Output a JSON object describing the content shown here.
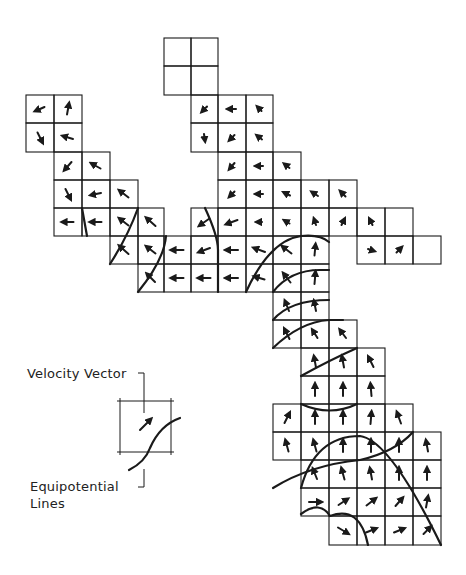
{
  "figure": {
    "cell_size": 28,
    "col_x": [
      26,
      54,
      82,
      110,
      138,
      164,
      191,
      218,
      246,
      273,
      301,
      329,
      357,
      385,
      413,
      441
    ],
    "row_y": [
      38,
      66,
      95,
      123,
      152,
      180,
      208,
      236,
      264,
      292,
      320,
      348,
      376,
      404,
      432,
      460,
      488,
      516,
      545
    ],
    "cells": [
      {
        "r": 0,
        "c": 5,
        "v": null
      },
      {
        "r": 0,
        "c": 6,
        "v": null
      },
      {
        "r": 1,
        "c": 5,
        "v": null
      },
      {
        "r": 1,
        "c": 6,
        "v": null
      },
      {
        "r": 2,
        "c": 0,
        "v": [
          -9,
          4
        ]
      },
      {
        "r": 2,
        "c": 1,
        "v": [
          2,
          -11
        ]
      },
      {
        "r": 2,
        "c": 6,
        "v": [
          -5,
          5
        ]
      },
      {
        "r": 2,
        "c": 7,
        "v": [
          -8,
          0
        ]
      },
      {
        "r": 2,
        "c": 8,
        "v": [
          -4,
          -4
        ]
      },
      {
        "r": 3,
        "c": 0,
        "v": [
          5,
          10
        ]
      },
      {
        "r": 3,
        "c": 1,
        "v": [
          -10,
          -3
        ]
      },
      {
        "r": 3,
        "c": 6,
        "v": [
          1,
          7
        ]
      },
      {
        "r": 3,
        "c": 7,
        "v": [
          -5,
          5
        ]
      },
      {
        "r": 3,
        "c": 8,
        "v": [
          -5,
          -4
        ]
      },
      {
        "r": 4,
        "c": 1,
        "v": [
          -7,
          8
        ]
      },
      {
        "r": 4,
        "c": 2,
        "v": [
          -9,
          -5
        ]
      },
      {
        "r": 4,
        "c": 7,
        "v": [
          -5,
          6
        ]
      },
      {
        "r": 4,
        "c": 8,
        "v": [
          -7,
          0
        ]
      },
      {
        "r": 4,
        "c": 9,
        "v": [
          -5,
          -4
        ]
      },
      {
        "r": 5,
        "c": 1,
        "v": [
          5,
          10
        ]
      },
      {
        "r": 5,
        "c": 2,
        "v": [
          -10,
          2
        ]
      },
      {
        "r": 5,
        "c": 3,
        "v": [
          -9,
          -7
        ]
      },
      {
        "r": 5,
        "c": 7,
        "v": [
          -5,
          5
        ]
      },
      {
        "r": 5,
        "c": 8,
        "v": [
          -7,
          0
        ]
      },
      {
        "r": 5,
        "c": 9,
        "v": [
          -6,
          -3
        ]
      },
      {
        "r": 5,
        "c": 10,
        "v": [
          -6,
          -4
        ]
      },
      {
        "r": 5,
        "c": 11,
        "v": [
          -5,
          -5
        ]
      },
      {
        "r": 6,
        "c": 1,
        "v": [
          -11,
          0
        ]
      },
      {
        "r": 6,
        "c": 2,
        "v": [
          -11,
          0
        ]
      },
      {
        "r": 6,
        "c": 3,
        "v": [
          -9,
          -7
        ]
      },
      {
        "r": 6,
        "c": 4,
        "v": [
          -9,
          -8
        ]
      },
      {
        "r": 6,
        "c": 6,
        "v": [
          -10,
          7
        ]
      },
      {
        "r": 6,
        "c": 7,
        "v": [
          -11,
          4
        ]
      },
      {
        "r": 6,
        "c": 8,
        "v": [
          -5,
          0
        ]
      },
      {
        "r": 6,
        "c": 9,
        "v": [
          -5,
          -3
        ]
      },
      {
        "r": 6,
        "c": 10,
        "v": [
          -2,
          -6
        ]
      },
      {
        "r": 6,
        "c": 11,
        "v": [
          3,
          -6
        ]
      },
      {
        "r": 6,
        "c": 12,
        "v": [
          -3,
          -6
        ]
      },
      {
        "r": 6,
        "c": 13,
        "v": null
      },
      {
        "r": 7,
        "c": 3,
        "v": [
          -9,
          -8
        ]
      },
      {
        "r": 7,
        "c": 4,
        "v": [
          -9,
          -7
        ]
      },
      {
        "r": 7,
        "c": 5,
        "v": [
          -12,
          0
        ]
      },
      {
        "r": 7,
        "c": 6,
        "v": [
          -11,
          4
        ]
      },
      {
        "r": 7,
        "c": 7,
        "v": [
          -12,
          0
        ]
      },
      {
        "r": 7,
        "c": 8,
        "v": [
          -11,
          -4
        ]
      },
      {
        "r": 7,
        "c": 9,
        "v": [
          -9,
          -7
        ]
      },
      {
        "r": 7,
        "c": 10,
        "v": [
          1,
          -11
        ]
      },
      {
        "r": 7,
        "c": 12,
        "v": [
          6,
          2
        ]
      },
      {
        "r": 7,
        "c": 13,
        "v": [
          5,
          -5
        ]
      },
      {
        "r": 7,
        "c": 14,
        "v": null
      },
      {
        "r": 8,
        "c": 4,
        "v": [
          -8,
          -8
        ]
      },
      {
        "r": 8,
        "c": 5,
        "v": [
          -12,
          0
        ]
      },
      {
        "r": 8,
        "c": 6,
        "v": [
          -12,
          0
        ]
      },
      {
        "r": 8,
        "c": 7,
        "v": [
          -12,
          0
        ]
      },
      {
        "r": 8,
        "c": 8,
        "v": [
          -10,
          -3
        ]
      },
      {
        "r": 8,
        "c": 9,
        "v": [
          -7,
          -9
        ]
      },
      {
        "r": 8,
        "c": 10,
        "v": [
          1,
          -12
        ]
      },
      {
        "r": 9,
        "c": 9,
        "v": [
          -4,
          -10
        ]
      },
      {
        "r": 9,
        "c": 10,
        "v": [
          -2,
          -10
        ]
      },
      {
        "r": 10,
        "c": 9,
        "v": [
          -5,
          -10
        ]
      },
      {
        "r": 10,
        "c": 10,
        "v": [
          -5,
          -8
        ]
      },
      {
        "r": 10,
        "c": 11,
        "v": [
          -6,
          -8
        ]
      },
      {
        "r": 11,
        "c": 10,
        "v": [
          -2,
          -11
        ]
      },
      {
        "r": 11,
        "c": 11,
        "v": [
          -2,
          -11
        ]
      },
      {
        "r": 11,
        "c": 12,
        "v": [
          -5,
          -10
        ]
      },
      {
        "r": 12,
        "c": 10,
        "v": [
          0,
          -12
        ]
      },
      {
        "r": 12,
        "c": 11,
        "v": [
          0,
          -12
        ]
      },
      {
        "r": 12,
        "c": 12,
        "v": [
          -1,
          -12
        ]
      },
      {
        "r": 13,
        "c": 9,
        "v": [
          5,
          -10
        ]
      },
      {
        "r": 13,
        "c": 10,
        "v": [
          0,
          -12
        ]
      },
      {
        "r": 13,
        "c": 11,
        "v": [
          0,
          -12
        ]
      },
      {
        "r": 13,
        "c": 12,
        "v": [
          1,
          -12
        ]
      },
      {
        "r": 13,
        "c": 13,
        "v": [
          -4,
          -11
        ]
      },
      {
        "r": 14,
        "c": 9,
        "v": [
          -3,
          -11
        ]
      },
      {
        "r": 14,
        "c": 10,
        "v": [
          -3,
          -11
        ]
      },
      {
        "r": 14,
        "c": 11,
        "v": [
          0,
          -12
        ]
      },
      {
        "r": 14,
        "c": 12,
        "v": [
          0,
          -12
        ]
      },
      {
        "r": 14,
        "c": 13,
        "v": [
          0,
          -12
        ]
      },
      {
        "r": 14,
        "c": 14,
        "v": [
          -2,
          -11
        ]
      },
      {
        "r": 15,
        "c": 10,
        "v": [
          -4,
          -10
        ]
      },
      {
        "r": 15,
        "c": 11,
        "v": [
          -3,
          -11
        ]
      },
      {
        "r": 15,
        "c": 12,
        "v": [
          -2,
          -11
        ]
      },
      {
        "r": 15,
        "c": 13,
        "v": [
          0,
          -12
        ]
      },
      {
        "r": 15,
        "c": 14,
        "v": [
          0,
          -12
        ]
      },
      {
        "r": 16,
        "c": 10,
        "v": [
          12,
          0
        ]
      },
      {
        "r": 16,
        "c": 11,
        "v": [
          9,
          -6
        ]
      },
      {
        "r": 16,
        "c": 12,
        "v": [
          9,
          -7
        ]
      },
      {
        "r": 16,
        "c": 13,
        "v": [
          7,
          -8
        ]
      },
      {
        "r": 16,
        "c": 14,
        "v": [
          2,
          -11
        ]
      },
      {
        "r": 17,
        "c": 11,
        "v": [
          10,
          6
        ]
      },
      {
        "r": 17,
        "c": 12,
        "v": [
          10,
          -4
        ]
      },
      {
        "r": 17,
        "c": 13,
        "v": [
          10,
          -4
        ]
      },
      {
        "r": 17,
        "c": 14,
        "v": [
          7,
          -7
        ]
      }
    ],
    "equipotential_lines": [
      "M 82 208 L 87 236",
      "M 110 264 Q 128 236 138 208",
      "M 138 292 Q 164 260 166 236",
      "M 205 208 Q 218 236 218 250 L 218 292",
      "M 246 292 Q 270 240 301 236 Q 320 234 329 242",
      "M 273 292 Q 290 270 320 270 L 329 270",
      "M 273 320 Q 290 300 329 300",
      "M 273 348 Q 300 322 329 320 L 343 320",
      "M 301 376 Q 330 360 357 348",
      "M 301 404 Q 330 417 357 404",
      "M 273 488 Q 310 465 360 460 Q 395 452 413 432",
      "M 301 488 Q 315 436 360 436 Q 390 440 441 545",
      "M 301 514 Q 320 500 330 516 Q 360 505 368 545"
    ],
    "legend": {
      "velocity_label": "Velocity  Vector",
      "equipotential_label_line1": "Equipotential",
      "equipotential_label_line2": "Lines",
      "box": {
        "x": 120,
        "y": 401,
        "size": 51
      },
      "sample_vector": [
        9,
        -9
      ]
    },
    "colors": {
      "ink": "#1a1a1a",
      "background": "#ffffff"
    }
  }
}
